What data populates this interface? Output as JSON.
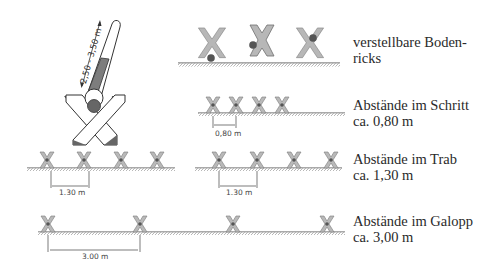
{
  "pole": {
    "length_label": "2,50 - 3,50 m"
  },
  "rows": [
    {
      "id": "adjustable",
      "caption_line1": "verstellbare Boden-",
      "caption_line2": "ricks"
    },
    {
      "id": "walk",
      "caption_line1": "Abstände im Schritt",
      "caption_line2": "ca. 0,80 m",
      "dim_label": "0,80 m"
    },
    {
      "id": "trot",
      "caption_line1": "Abstände im Trab",
      "caption_line2": "ca. 1,30 m",
      "dim_label_left": "1.30 m",
      "dim_label_right": "1.30 m"
    },
    {
      "id": "canter",
      "caption_line1": "Abstände im Galopp",
      "caption_line2": "ca. 3,00 m",
      "dim_label": "3.00 m"
    }
  ],
  "colors": {
    "cross_fill": "#b4b4b4",
    "cross_stroke": "#6a6a6a",
    "pole_dark": "#7a7a7a",
    "ground": "#555555",
    "text": "#2a2a2a"
  }
}
